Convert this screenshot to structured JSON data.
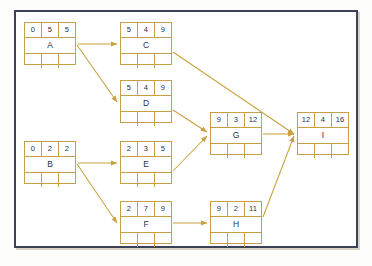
{
  "diagram": {
    "type": "pert-cpm-network",
    "colors": {
      "frame_border": "#3b4258",
      "node_border": "#c79f47",
      "node_fill": "#ffffff",
      "text": "#28304a",
      "arrow": "#c9a23f",
      "page_background": "#fdfdfb"
    },
    "node_cell_meaning": [
      "earliest-start",
      "duration",
      "earliest-finish"
    ],
    "nodes": [
      {
        "id": "A",
        "label": "A",
        "top": [
          "0",
          "5",
          "5"
        ],
        "bottom": [
          "",
          "",
          ""
        ],
        "x": 8,
        "y": 10
      },
      {
        "id": "C",
        "label": "C",
        "top": [
          "5",
          "4",
          "9"
        ],
        "bottom": [
          "",
          "",
          ""
        ],
        "x": 104,
        "y": 10
      },
      {
        "id": "D",
        "label": "D",
        "top": [
          "5",
          "4",
          "9"
        ],
        "bottom": [
          "",
          "",
          ""
        ],
        "x": 104,
        "y": 68
      },
      {
        "id": "B",
        "label": "B",
        "top": [
          "0",
          "2",
          "2"
        ],
        "bottom": [
          "",
          "",
          ""
        ],
        "x": 8,
        "y": 129
      },
      {
        "id": "E",
        "label": "E",
        "top": [
          "2",
          "3",
          "5"
        ],
        "bottom": [
          "",
          "",
          ""
        ],
        "x": 104,
        "y": 129
      },
      {
        "id": "F",
        "label": "F",
        "top": [
          "2",
          "7",
          "9"
        ],
        "bottom": [
          "",
          "",
          ""
        ],
        "x": 104,
        "y": 189
      },
      {
        "id": "G",
        "label": "G",
        "top": [
          "9",
          "3",
          "12"
        ],
        "bottom": [
          "",
          "",
          ""
        ],
        "x": 194,
        "y": 100
      },
      {
        "id": "H",
        "label": "H",
        "top": [
          "9",
          "2",
          "11"
        ],
        "bottom": [
          "",
          "",
          ""
        ],
        "x": 194,
        "y": 189
      },
      {
        "id": "I",
        "label": "I",
        "top": [
          "12",
          "4",
          "16"
        ],
        "bottom": [
          "",
          "",
          ""
        ],
        "x": 281,
        "y": 100
      }
    ],
    "edges": [
      {
        "id": "A-C",
        "from": "A",
        "to": "C",
        "path": "M 62,32 L 101,32"
      },
      {
        "id": "A-D",
        "from": "A",
        "to": "D",
        "path": "M 61,33 L 101,90"
      },
      {
        "id": "B-E",
        "from": "B",
        "to": "E",
        "path": "M 62,151 L 101,151"
      },
      {
        "id": "B-F",
        "from": "B",
        "to": "F",
        "path": "M 61,152 L 101,211"
      },
      {
        "id": "C-I",
        "from": "C",
        "to": "I",
        "path": "M 157,40 L 278,122"
      },
      {
        "id": "D-G",
        "from": "D",
        "to": "G",
        "path": "M 157,98 L 191,120"
      },
      {
        "id": "E-G",
        "from": "E",
        "to": "G",
        "path": "M 157,159 L 191,124"
      },
      {
        "id": "F-H",
        "from": "F",
        "to": "H",
        "path": "M 157,211 L 191,211"
      },
      {
        "id": "G-I",
        "from": "G",
        "to": "I",
        "path": "M 247,122 L 278,122"
      },
      {
        "id": "H-I",
        "from": "H",
        "to": "I",
        "path": "M 247,205 L 278,124"
      }
    ]
  }
}
